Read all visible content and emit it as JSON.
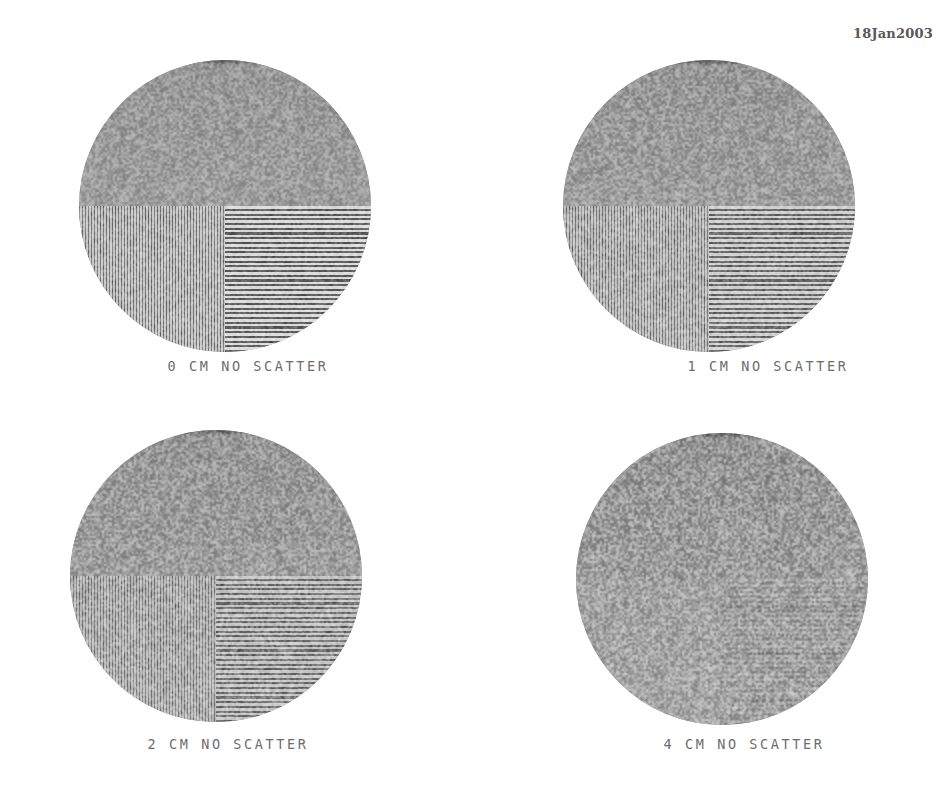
{
  "figure": {
    "date_stamp": "18Jan2003",
    "background_color": "#ffffff",
    "phantom_gray": "#9c9c9c",
    "crosshair_color": "#6a6a6a",
    "caption_color": "#6d6d6d",
    "layout": "2x2 grid of circular line-pair resolution phantoms",
    "panels": [
      {
        "id": "0",
        "thickness_cm": "0",
        "scatter": "NO SCATTER",
        "caption": "0 CM NO SCATTER",
        "quadrants": {
          "top_left": "uniform",
          "top_right": "uniform",
          "bottom_left": "vertical line pairs",
          "bottom_right": "horizontal line pairs"
        },
        "bar_amplitude": 0.5,
        "bar_blur_px": 0.35,
        "cross_blur_px": 0.8,
        "global_blur_px": 0.0,
        "noise_opacity": 0.55
      },
      {
        "id": "1",
        "thickness_cm": "1",
        "scatter": "NO SCATTER",
        "caption": "1 CM NO SCATTER",
        "quadrants": {
          "top_left": "uniform",
          "top_right": "uniform",
          "bottom_left": "vertical line pairs",
          "bottom_right": "horizontal line pairs"
        },
        "bar_amplitude": 0.42,
        "bar_blur_px": 0.5,
        "cross_blur_px": 1.0,
        "global_blur_px": 0.15,
        "noise_opacity": 0.6
      },
      {
        "id": "2",
        "thickness_cm": "2",
        "scatter": "NO SCATTER",
        "caption": "2 CM NO SCATTER",
        "quadrants": {
          "top_left": "uniform",
          "top_right": "uniform",
          "bottom_left": "vertical line pairs",
          "bottom_right": "horizontal line pairs"
        },
        "bar_amplitude": 0.33,
        "bar_blur_px": 0.65,
        "cross_blur_px": 1.1,
        "global_blur_px": 0.25,
        "noise_opacity": 0.66
      },
      {
        "id": "4",
        "thickness_cm": "4",
        "scatter": "NO SCATTER",
        "caption": "4 CM NO SCATTER",
        "quadrants": {
          "top_left": "uniform",
          "top_right": "uniform",
          "bottom_left": "vertical line pairs (barely resolved)",
          "bottom_right": "horizontal line pairs"
        },
        "bar_amplitude": 0.17,
        "bar_blur_px": 1.05,
        "cross_blur_px": 1.5,
        "global_blur_px": 0.5,
        "noise_opacity": 0.74
      }
    ]
  }
}
